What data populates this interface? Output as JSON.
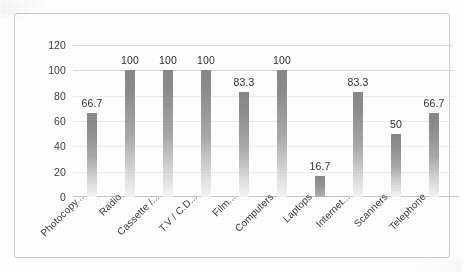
{
  "chart_data": {
    "type": "bar",
    "title": "",
    "subtitle": "",
    "xlabel": "",
    "ylabel": "",
    "ylim": [
      0,
      120
    ],
    "ytick_step": 20,
    "yticks": [
      "120",
      "100",
      "80",
      "60",
      "40",
      "20",
      "0"
    ],
    "grid": true,
    "grid_orientation": "horizontal",
    "legend": false,
    "legend_position": "none",
    "data_labels": true,
    "categories": [
      "Photocopy...",
      "Radio",
      "Cassette /...",
      "T.V / C.D...",
      "Film...",
      "Computers",
      "Laptops",
      "Internet...",
      "Scanners",
      "Telephone"
    ],
    "values": [
      66.7,
      100,
      100,
      100,
      83.3,
      100,
      16.7,
      83.3,
      50,
      66.7
    ],
    "value_labels": [
      "66.7",
      "100",
      "100",
      "100",
      "83.3",
      "100",
      "16.7",
      "83.3",
      "50",
      "66.7"
    ],
    "bar_color": "#8d8d8d",
    "bar_color_bottom": "#f6f6f6",
    "grid_color": "#d8d8d8",
    "axis_color": "#c6c6c6",
    "text_color": "#3a3a3a",
    "border_color": "#cfcfcf"
  }
}
